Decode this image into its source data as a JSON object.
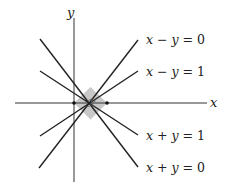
{
  "diagram": {
    "axes": {
      "x_label": "x",
      "y_label": "y"
    },
    "region_label": "ℛ",
    "region_fill": "#c8c8c8",
    "line_color": "#222222",
    "lines": [
      {
        "id": "x-minus-y-0",
        "label_var1": "x",
        "label_op": " − ",
        "label_var2": "y",
        "label_rhs": " = 0"
      },
      {
        "id": "x-minus-y-1",
        "label_var1": "x",
        "label_op": " − ",
        "label_var2": "y",
        "label_rhs": " = 1"
      },
      {
        "id": "x-plus-y-1",
        "label_var1": "x",
        "label_op": " + ",
        "label_var2": "y",
        "label_rhs": " = 1"
      },
      {
        "id": "x-plus-y-0",
        "label_var1": "x",
        "label_op": " + ",
        "label_var2": "y",
        "label_rhs": " = 0"
      }
    ]
  }
}
